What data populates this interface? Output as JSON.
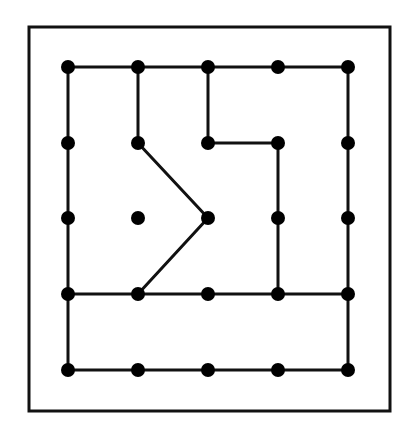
{
  "diagram": {
    "type": "geoboard",
    "grid": {
      "cols": 5,
      "rows": 5
    },
    "frame": {
      "x": 29,
      "y": 27,
      "width": 361,
      "height": 384,
      "stroke": "#111111",
      "stroke_width": 3
    },
    "colors": {
      "line": "#111111",
      "dot": "#000000",
      "background": "#ffffff"
    },
    "x_positions": [
      68,
      138,
      208,
      278,
      348
    ],
    "y_positions": [
      67,
      143,
      218,
      294,
      370
    ],
    "dot_radius": 7,
    "segments": [
      [
        [
          0,
          0
        ],
        [
          4,
          0
        ]
      ],
      [
        [
          0,
          0
        ],
        [
          0,
          4
        ]
      ],
      [
        [
          4,
          0
        ],
        [
          4,
          4
        ]
      ],
      [
        [
          0,
          4
        ],
        [
          4,
          4
        ]
      ],
      [
        [
          0,
          3
        ],
        [
          4,
          3
        ]
      ],
      [
        [
          1,
          0
        ],
        [
          1,
          1
        ]
      ],
      [
        [
          1,
          1
        ],
        [
          2,
          2
        ]
      ],
      [
        [
          2,
          2
        ],
        [
          1,
          3
        ]
      ],
      [
        [
          2,
          0
        ],
        [
          2,
          1
        ]
      ],
      [
        [
          2,
          1
        ],
        [
          3,
          1
        ]
      ],
      [
        [
          3,
          1
        ],
        [
          3,
          3
        ]
      ]
    ]
  }
}
